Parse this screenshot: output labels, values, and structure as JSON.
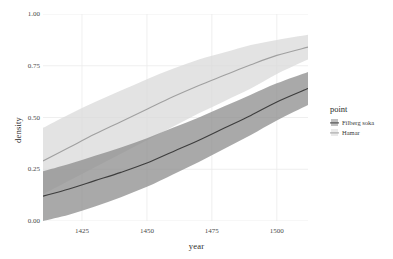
{
  "chart_data": {
    "type": "line",
    "title": "",
    "xlabel": "year",
    "ylabel": "density",
    "xlim": [
      1410,
      1512
    ],
    "ylim": [
      0.0,
      1.0
    ],
    "grid": true,
    "legend_position": "right",
    "legend_title": "point",
    "x_ticks": [
      1425,
      1450,
      1475,
      1500
    ],
    "x_tick_labels": [
      "1425",
      "1450",
      "1475",
      "1500"
    ],
    "y_ticks": [
      0.0,
      0.25,
      0.5,
      0.75,
      1.0
    ],
    "y_tick_labels": [
      "0.00",
      "0.25",
      "0.50",
      "0.75",
      "1.00"
    ],
    "x": [
      1410,
      1420,
      1430,
      1440,
      1450,
      1460,
      1470,
      1480,
      1490,
      1500,
      1512
    ],
    "series": [
      {
        "name": "Filberg soka",
        "color": "#3d3d3d",
        "ribbon_color": "#8c8c8c",
        "values": [
          0.12,
          0.155,
          0.195,
          0.235,
          0.28,
          0.335,
          0.39,
          0.45,
          0.51,
          0.575,
          0.64
        ],
        "ribbon_lower": [
          0.0,
          0.03,
          0.07,
          0.115,
          0.165,
          0.225,
          0.285,
          0.35,
          0.415,
          0.485,
          0.56
        ],
        "ribbon_upper": [
          0.24,
          0.275,
          0.315,
          0.355,
          0.4,
          0.45,
          0.5,
          0.555,
          0.61,
          0.665,
          0.72
        ]
      },
      {
        "name": "Hamar",
        "color": "#a0a0a0",
        "ribbon_color": "#d9d9d9",
        "values": [
          0.29,
          0.355,
          0.42,
          0.48,
          0.54,
          0.6,
          0.655,
          0.705,
          0.755,
          0.8,
          0.84
        ],
        "ribbon_lower": [
          0.13,
          0.195,
          0.26,
          0.325,
          0.39,
          0.455,
          0.52,
          0.58,
          0.64,
          0.71,
          0.78
        ],
        "ribbon_upper": [
          0.45,
          0.515,
          0.575,
          0.63,
          0.685,
          0.735,
          0.78,
          0.815,
          0.85,
          0.875,
          0.9
        ]
      }
    ]
  },
  "legend": {
    "title": "point",
    "entries": [
      {
        "label": "Filberg soka"
      },
      {
        "label": "Hamar"
      }
    ]
  }
}
